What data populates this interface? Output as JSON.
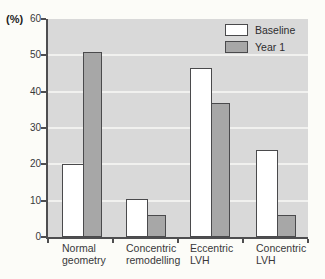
{
  "figure": {
    "percent_label": "(%)"
  },
  "chart_data": {
    "type": "bar",
    "title": "",
    "xlabel": "",
    "ylabel": "(%)",
    "categories": [
      "Normal geometry",
      "Concentric remodelling",
      "Eccentric LVH",
      "Concentric LVH"
    ],
    "category_label_lines": [
      [
        "Normal",
        "geometry"
      ],
      [
        "Concentric",
        "remodelling"
      ],
      [
        "Eccentric",
        "LVH"
      ],
      [
        "Concentric",
        "LVH"
      ]
    ],
    "series": [
      {
        "name": "Baseline",
        "fill": "#ffffff",
        "values": [
          20,
          10.5,
          46.5,
          24
        ]
      },
      {
        "name": "Year 1",
        "fill": "#a7a7a7",
        "values": [
          51,
          6,
          37,
          6
        ]
      }
    ],
    "ylim": [
      0,
      60
    ],
    "yticks": [
      0,
      10,
      20,
      30,
      40,
      50,
      60
    ],
    "grid": true,
    "legend_position": "top-right",
    "colors": {
      "page_background": "#fcfcf8",
      "plot_background": "#d9d9d9",
      "gridline": "#f1f1ef",
      "axis": "#4e4e50",
      "bar_border": "#4a4a4c",
      "text": "#38383a"
    }
  }
}
